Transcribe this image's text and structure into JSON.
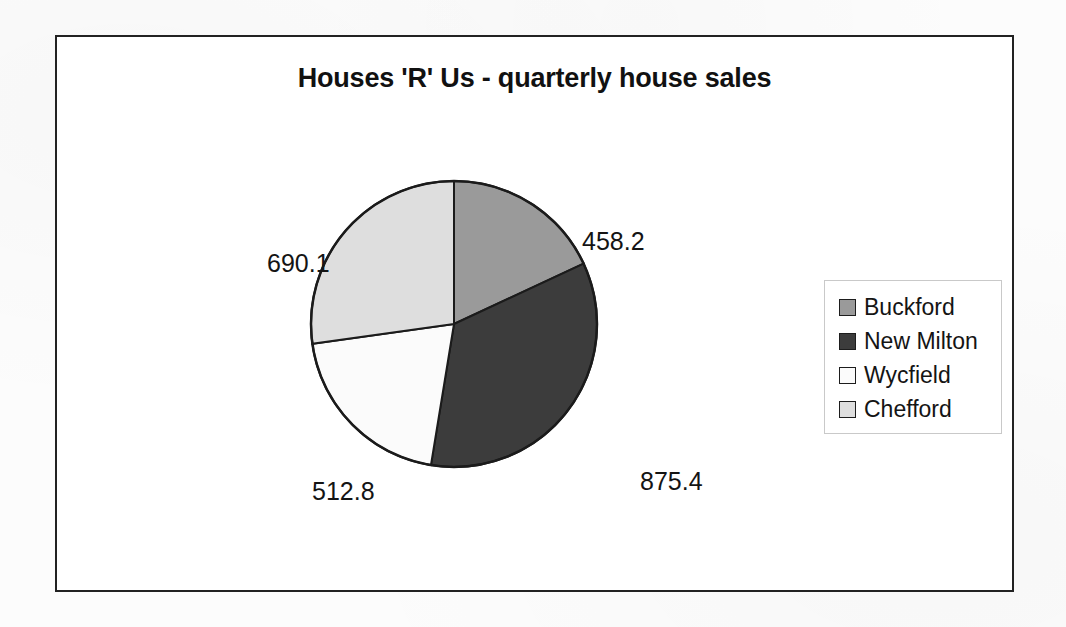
{
  "chart_data": {
    "type": "pie",
    "title": "Houses 'R' Us - quarterly house sales",
    "categories": [
      "Buckford",
      "New Milton",
      "Wycfield",
      "Chefford"
    ],
    "values": [
      458.2,
      875.4,
      512.8,
      690.1
    ],
    "labels": [
      "458.2",
      "875.4",
      "512.8",
      "690.1"
    ],
    "total": 2536.5,
    "slice_colors": [
      "#9a9a9a",
      "#3c3c3c",
      "#fbfbfb",
      "#dedede"
    ],
    "slice_angles_deg": [
      65.0,
      124.3,
      72.8,
      97.9
    ],
    "start_angle_deg": 0,
    "direction": "clockwise",
    "legend_position": "right",
    "grid": false,
    "xlabel": "",
    "ylabel": ""
  },
  "frame": {
    "border_color": "#222222"
  },
  "legend": {
    "entries": [
      {
        "label": "Buckford",
        "color": "#9a9a9a"
      },
      {
        "label": "New Milton",
        "color": "#3c3c3c"
      },
      {
        "label": "Wycfield",
        "color": "#fbfbfb"
      },
      {
        "label": "Chefford",
        "color": "#dedede"
      }
    ]
  }
}
